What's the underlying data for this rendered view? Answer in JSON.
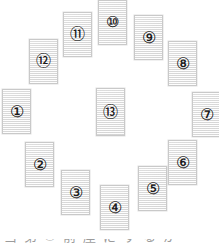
{
  "figure": {
    "background_color": "#ffffff",
    "card_fill_color": "#e6e6e6",
    "card_border_color": "#c9c9c9",
    "glyph_color": "#1a1a1a",
    "card_count": 13,
    "layout": "ring-with-center"
  },
  "cards": [
    {
      "id": "card-1",
      "label": "①",
      "number": 1,
      "x": 2,
      "y": 89,
      "w": 29,
      "h": 45,
      "digits": 1
    },
    {
      "id": "card-2",
      "label": "②",
      "number": 2,
      "x": 25,
      "y": 142,
      "w": 29,
      "h": 45,
      "digits": 1
    },
    {
      "id": "card-3",
      "label": "③",
      "number": 3,
      "x": 61,
      "y": 170,
      "w": 29,
      "h": 45,
      "digits": 1
    },
    {
      "id": "card-4",
      "label": "④",
      "number": 4,
      "x": 100,
      "y": 185,
      "w": 29,
      "h": 45,
      "digits": 1
    },
    {
      "id": "card-5",
      "label": "⑤",
      "number": 5,
      "x": 138,
      "y": 166,
      "w": 29,
      "h": 45,
      "digits": 1
    },
    {
      "id": "card-6",
      "label": "⑥",
      "number": 6,
      "x": 168,
      "y": 140,
      "w": 29,
      "h": 45,
      "digits": 1
    },
    {
      "id": "card-7",
      "label": "⑦",
      "number": 7,
      "x": 192,
      "y": 92,
      "w": 29,
      "h": 45,
      "digits": 1
    },
    {
      "id": "card-8",
      "label": "⑧",
      "number": 8,
      "x": 168,
      "y": 41,
      "w": 29,
      "h": 45,
      "digits": 1
    },
    {
      "id": "card-9",
      "label": "⑨",
      "number": 9,
      "x": 134,
      "y": 15,
      "w": 29,
      "h": 45,
      "digits": 1
    },
    {
      "id": "card-10",
      "label": "⑩",
      "number": 10,
      "x": 98,
      "y": 0,
      "w": 29,
      "h": 45,
      "digits": 2
    },
    {
      "id": "card-11",
      "label": "⑪",
      "number": 11,
      "x": 63,
      "y": 12,
      "w": 29,
      "h": 45,
      "digits": 2
    },
    {
      "id": "card-12",
      "label": "⑫",
      "number": 12,
      "x": 29,
      "y": 39,
      "w": 29,
      "h": 45,
      "digits": 2
    },
    {
      "id": "card-13",
      "label": "⑬",
      "number": 13,
      "x": 96,
      "y": 88,
      "w": 29,
      "h": 48,
      "digits": 2
    }
  ],
  "caption": {
    "y": 239,
    "clipped": true,
    "glyphs": [
      "当",
      "第",
      "①",
      "前",
      "座",
      "に",
      "す",
      "る",
      "か"
    ]
  }
}
